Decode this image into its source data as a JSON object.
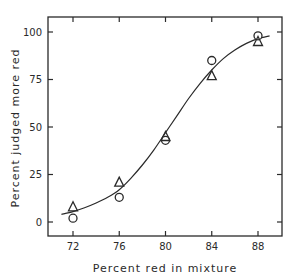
{
  "chart_data": {
    "type": "scatter",
    "title": "",
    "xlabel": "Percent red in mixture",
    "ylabel": "Percent judged more red",
    "xlim": [
      70.5,
      90.5
    ],
    "ylim": [
      -8,
      108
    ],
    "x_ticks": [
      72,
      76,
      80,
      84,
      88
    ],
    "y_ticks": [
      0,
      25,
      50,
      75,
      100
    ],
    "grid": false,
    "legend": null,
    "series": [
      {
        "name": "circles",
        "marker": "circle",
        "x": [
          72,
          76,
          80,
          84,
          88
        ],
        "y": [
          2,
          13,
          43,
          85,
          98
        ]
      },
      {
        "name": "triangles",
        "marker": "triangle",
        "x": [
          72,
          76,
          80,
          84,
          88
        ],
        "y": [
          8,
          21,
          45,
          77,
          95
        ]
      }
    ],
    "fit_curve": {
      "name": "fitted ogive",
      "x": [
        71,
        72,
        73,
        74,
        75,
        76,
        77,
        78,
        79,
        80,
        81,
        82,
        83,
        84,
        85,
        86,
        87,
        88,
        89
      ],
      "y": [
        4,
        5.5,
        7.5,
        10,
        13,
        17,
        23,
        30,
        38,
        47,
        56,
        65,
        73,
        80,
        86,
        90.5,
        94,
        96.5,
        98
      ]
    }
  },
  "axes": {
    "x_tick_labels": [
      "72",
      "76",
      "80",
      "84",
      "88"
    ],
    "y_tick_labels": [
      "0",
      "25",
      "50",
      "75",
      "100"
    ],
    "xlabel": "Percent red in mixture",
    "ylabel": "Percent judged more red"
  }
}
